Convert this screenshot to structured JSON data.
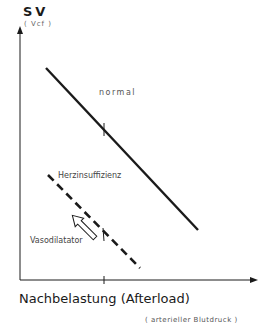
{
  "diagram": {
    "y_axis": {
      "label": "SV",
      "unit": "( Vcf )"
    },
    "x_axis": {
      "label": "Nachbelastung (Afterload)",
      "unit": "( arterieller  Blutdruck )"
    },
    "curves": [
      {
        "name": "normal",
        "label": "normal",
        "style": "solid"
      },
      {
        "name": "herzinsuffizienz",
        "label": "Herzinsuffizienz",
        "style": "dashed"
      }
    ],
    "arrow": {
      "label": "Vasodilatator",
      "direction": "up-left"
    },
    "colors": {
      "ink": "#1a1a1a",
      "background": "#ffffff"
    }
  }
}
